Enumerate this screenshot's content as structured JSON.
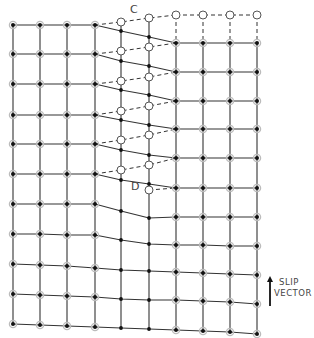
{
  "labels": {
    "c": "C",
    "d": "D",
    "slip_vector_line1": "SLIP",
    "slip_vector_line2": "VECTOR"
  },
  "colors": {
    "line": "#333333",
    "node_fill": "#111111",
    "node_halo": "#bbbbbb",
    "open_fill": "#ffffff",
    "open_stroke": "#555555"
  },
  "grid": {
    "columns_x": [
      13,
      40,
      67,
      95,
      121,
      149,
      176,
      203,
      230,
      257
    ],
    "halo_columns": [
      0,
      1,
      2,
      3,
      6,
      7,
      8,
      9
    ],
    "rows_y": [
      [
        25,
        25,
        25,
        25,
        31,
        37,
        43,
        43,
        43,
        43
      ],
      [
        54,
        54,
        54,
        54,
        61,
        66,
        72,
        72,
        72,
        72
      ],
      [
        84,
        84,
        84,
        84,
        90,
        95,
        101,
        101,
        101,
        101
      ],
      [
        115,
        115,
        115,
        115,
        120,
        125,
        129,
        129,
        129,
        129
      ],
      [
        144,
        144,
        144,
        144,
        150,
        155,
        158,
        158,
        158,
        158
      ],
      [
        174,
        174,
        174,
        174,
        180,
        184,
        188,
        188,
        188,
        188
      ],
      [
        204,
        204,
        204,
        204,
        211,
        218,
        217,
        217,
        217,
        217
      ],
      [
        234,
        234,
        235,
        235,
        240,
        244,
        245,
        245,
        246,
        246
      ],
      [
        264,
        265,
        266,
        268,
        270,
        271,
        272,
        273,
        274,
        275
      ],
      [
        294,
        295,
        296,
        297,
        299,
        300,
        300,
        301,
        302,
        304
      ],
      [
        324,
        325,
        326,
        327,
        328,
        329,
        330,
        331,
        332,
        334
      ]
    ]
  },
  "dislocation": {
    "top_open_row_y": 15,
    "top_open_columns": [
      6,
      7,
      8,
      9
    ],
    "dashed_rows": [
      [
        [
          95,
          25
        ],
        [
          121,
          22
        ],
        [
          149,
          18
        ],
        [
          176,
          15
        ]
      ],
      [
        [
          95,
          54
        ],
        [
          121,
          51
        ],
        [
          149,
          47
        ],
        [
          176,
          43
        ]
      ],
      [
        [
          95,
          84
        ],
        [
          121,
          81
        ],
        [
          149,
          77
        ],
        [
          176,
          72
        ]
      ],
      [
        [
          95,
          115
        ],
        [
          121,
          111
        ],
        [
          149,
          106
        ],
        [
          176,
          101
        ]
      ],
      [
        [
          95,
          144
        ],
        [
          121,
          140
        ],
        [
          149,
          135
        ],
        [
          176,
          129
        ]
      ],
      [
        [
          95,
          174
        ],
        [
          121,
          170
        ],
        [
          149,
          165
        ],
        [
          176,
          158
        ]
      ]
    ],
    "open_points": [
      [
        121,
        22
      ],
      [
        149,
        18
      ],
      [
        121,
        51
      ],
      [
        149,
        47
      ],
      [
        121,
        81
      ],
      [
        149,
        77
      ],
      [
        121,
        111
      ],
      [
        149,
        106
      ],
      [
        121,
        140
      ],
      [
        149,
        135
      ],
      [
        121,
        170
      ],
      [
        149,
        165
      ]
    ],
    "point_d": [
      149,
      190
    ],
    "d_dashed_to": [
      176,
      188
    ],
    "middle_column_top_y": 22
  },
  "slip_vector": {
    "x": 270,
    "y_start": 306,
    "y_end": 276
  }
}
